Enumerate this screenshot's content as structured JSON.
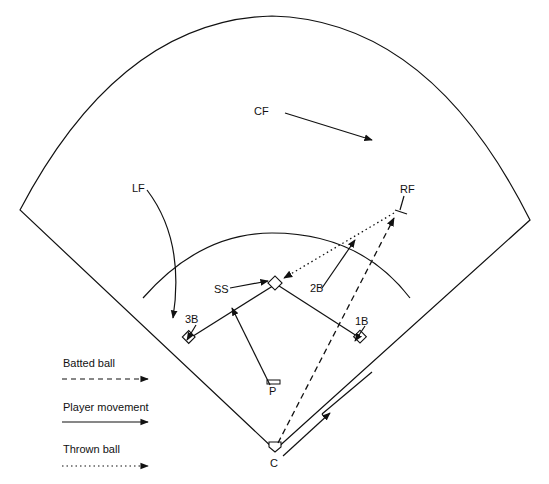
{
  "diagram": {
    "type": "baseball-field-play-diagram",
    "positions": {
      "cf": "CF",
      "lf": "LF",
      "rf": "RF",
      "ss": "SS",
      "second_base": "2B",
      "third_base": "3B",
      "first_base": "1B",
      "pitcher": "P",
      "catcher": "C"
    },
    "legend": {
      "batted_ball": "Batted ball",
      "player_movement": "Player movement",
      "thrown_ball": "Thrown ball"
    },
    "colors": {
      "line": "#111111",
      "background": "#ffffff"
    }
  }
}
